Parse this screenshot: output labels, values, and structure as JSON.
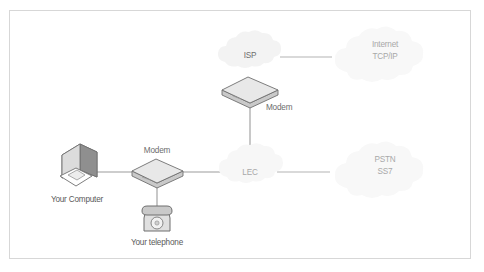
{
  "figure": {
    "type": "network-diagram",
    "border_color": "#d9d9d9",
    "background_color": "#ffffff"
  },
  "palette": {
    "cloud_fill": "#f4f4f4",
    "cloud_fill_faint": "#f7f7f7",
    "device_fill": "#e3e3e3",
    "device_top": "#ebebeb",
    "device_side": "#cfcfcf",
    "device_stroke": "#6f6f6f",
    "line_color": "#9b9b9b",
    "text_color": "#6d6d6d",
    "text_color_faint": "#a8a8a8"
  },
  "nodes": {
    "computer": {
      "label": "Your Computer",
      "icon": "desktop-computer-icon",
      "x": 78,
      "y": 167
    },
    "telephone": {
      "label": "Your telephone",
      "icon": "rotary-telephone-icon",
      "x": 157,
      "y": 215
    },
    "modem_user": {
      "label": "Modem",
      "icon": "modem-box-icon",
      "x": 157,
      "y": 172
    },
    "modem_isp": {
      "label": "Modem",
      "icon": "modem-box-icon",
      "x": 250,
      "y": 90
    },
    "isp_cloud": {
      "label": "ISP",
      "icon": "cloud-icon",
      "x": 250,
      "y": 62
    },
    "lec_cloud": {
      "label": "LEC",
      "icon": "cloud-icon",
      "x": 250,
      "y": 172
    },
    "internet_cloud": {
      "label_line1": "Internet",
      "label_line2": "TCP/IP",
      "icon": "cloud-icon",
      "x": 385,
      "y": 57
    },
    "pstn_cloud": {
      "label_line1": "PSTN",
      "label_line2": "SS7",
      "icon": "cloud-icon",
      "x": 385,
      "y": 172
    }
  },
  "edges": [
    {
      "name": "computer-to-modem",
      "from": "computer",
      "to": "modem_user"
    },
    {
      "name": "modem-to-telephone",
      "from": "modem_user",
      "to": "telephone"
    },
    {
      "name": "modem-to-lec",
      "from": "modem_user",
      "to": "lec_cloud"
    },
    {
      "name": "lec-to-isp-modem",
      "from": "lec_cloud",
      "to": "modem_isp"
    },
    {
      "name": "lec-to-pstn",
      "from": "lec_cloud",
      "to": "pstn_cloud"
    },
    {
      "name": "isp-to-internet",
      "from": "isp_cloud",
      "to": "internet_cloud"
    }
  ]
}
